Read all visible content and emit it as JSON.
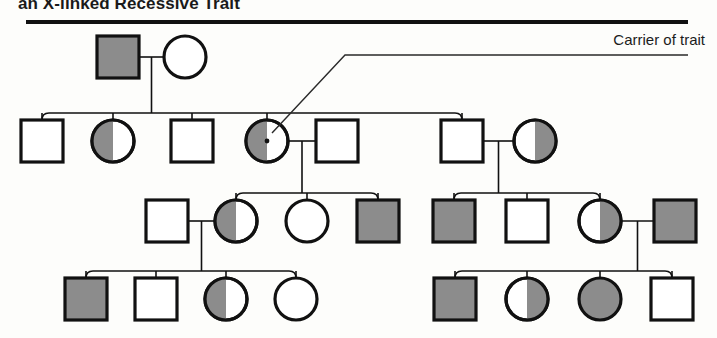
{
  "figure": {
    "title": "an X-linked Recessive Trait",
    "legend_label": "Carrier of trait",
    "colors": {
      "stroke": "#111111",
      "carrier_fill": "#8c8c8c",
      "affected_fill": "#8c8c8c",
      "unaffected_fill": "#ffffff",
      "background": "#fdfdfb",
      "leader_line": "#2a2a2a"
    }
  },
  "chart_data": {
    "type": "diagram",
    "title": "an X-linked Recessive Trait",
    "subtype": "pedigree-chart",
    "legend": [
      {
        "symbol": "half-filled",
        "label": "Carrier of trait"
      }
    ],
    "status_key": {
      "open": "unaffected",
      "half": "carrier",
      "filled": "affected"
    },
    "generations": [
      {
        "id": "I",
        "y": 57,
        "individuals": [
          {
            "id": "I-1",
            "sex": "male",
            "status": "filled",
            "x": 118,
            "label": "affected male"
          },
          {
            "id": "I-2",
            "sex": "female",
            "status": "open",
            "x": 185,
            "label": "unaffected female"
          }
        ]
      },
      {
        "id": "II",
        "y": 141,
        "individuals": [
          {
            "id": "II-1",
            "sex": "male",
            "status": "open",
            "x": 42,
            "label": "unaffected male"
          },
          {
            "id": "II-2",
            "sex": "female",
            "status": "half",
            "x": 113,
            "label": "carrier female"
          },
          {
            "id": "II-3",
            "sex": "male",
            "status": "open",
            "x": 192,
            "label": "unaffected male"
          },
          {
            "id": "II-4",
            "sex": "female",
            "status": "half",
            "x": 267,
            "label": "carrier female"
          },
          {
            "id": "II-5",
            "sex": "male",
            "status": "open",
            "x": 337,
            "label": "unaffected male"
          },
          {
            "id": "II-6",
            "sex": "male",
            "status": "open",
            "x": 462,
            "label": "unaffected male"
          },
          {
            "id": "II-7",
            "sex": "female",
            "status": "half-right",
            "x": 535,
            "label": "carrier female"
          }
        ]
      },
      {
        "id": "III",
        "y": 221,
        "individuals": [
          {
            "id": "III-1",
            "sex": "male",
            "status": "open",
            "x": 167,
            "label": "unaffected male"
          },
          {
            "id": "III-2",
            "sex": "female",
            "status": "half",
            "x": 236,
            "label": "carrier female"
          },
          {
            "id": "III-3",
            "sex": "female",
            "status": "open",
            "x": 307,
            "label": "unaffected female"
          },
          {
            "id": "III-4",
            "sex": "male",
            "status": "filled",
            "x": 378,
            "label": "affected male"
          },
          {
            "id": "III-5",
            "sex": "male",
            "status": "filled",
            "x": 454,
            "label": "affected male"
          },
          {
            "id": "III-6",
            "sex": "male",
            "status": "open",
            "x": 527,
            "label": "unaffected male"
          },
          {
            "id": "III-7",
            "sex": "female",
            "status": "half-right",
            "x": 600,
            "label": "carrier female"
          },
          {
            "id": "III-8",
            "sex": "male",
            "status": "filled",
            "x": 675,
            "label": "affected male"
          }
        ]
      },
      {
        "id": "IV",
        "y": 299,
        "individuals": [
          {
            "id": "IV-1",
            "sex": "male",
            "status": "filled",
            "x": 86,
            "label": "affected male"
          },
          {
            "id": "IV-2",
            "sex": "male",
            "status": "open",
            "x": 156,
            "label": "unaffected male"
          },
          {
            "id": "IV-3",
            "sex": "female",
            "status": "half",
            "x": 226,
            "label": "carrier female"
          },
          {
            "id": "IV-4",
            "sex": "female",
            "status": "open",
            "x": 296,
            "label": "unaffected female"
          },
          {
            "id": "IV-5",
            "sex": "male",
            "status": "filled",
            "x": 455,
            "label": "affected male"
          },
          {
            "id": "IV-6",
            "sex": "female",
            "status": "half-right",
            "x": 527,
            "label": "carrier female"
          },
          {
            "id": "IV-7",
            "sex": "female",
            "status": "filled",
            "x": 600,
            "label": "affected female"
          },
          {
            "id": "IV-8",
            "sex": "male",
            "status": "open",
            "x": 672,
            "label": "unaffected male"
          }
        ]
      }
    ],
    "matings": [
      {
        "parents": [
          "I-1",
          "I-2"
        ],
        "children": [
          "II-1",
          "II-2",
          "II-3",
          "II-4",
          "II-6"
        ]
      },
      {
        "parents": [
          "II-4",
          "II-5"
        ],
        "children": [
          "III-2",
          "III-3",
          "III-4"
        ]
      },
      {
        "parents": [
          "II-6",
          "II-7"
        ],
        "children": [
          "III-5",
          "III-6",
          "III-7"
        ]
      },
      {
        "parents": [
          "III-1",
          "III-2"
        ],
        "children": [
          "IV-1",
          "IV-2",
          "IV-3",
          "IV-4"
        ]
      },
      {
        "parents": [
          "III-7",
          "III-8"
        ],
        "children": [
          "IV-5",
          "IV-6",
          "IV-7",
          "IV-8"
        ]
      }
    ],
    "annotation": {
      "text": "Carrier of trait",
      "points_to": "II-4",
      "leader_from": [
        688,
        55
      ],
      "leader_to": [
        272,
        133
      ]
    }
  }
}
